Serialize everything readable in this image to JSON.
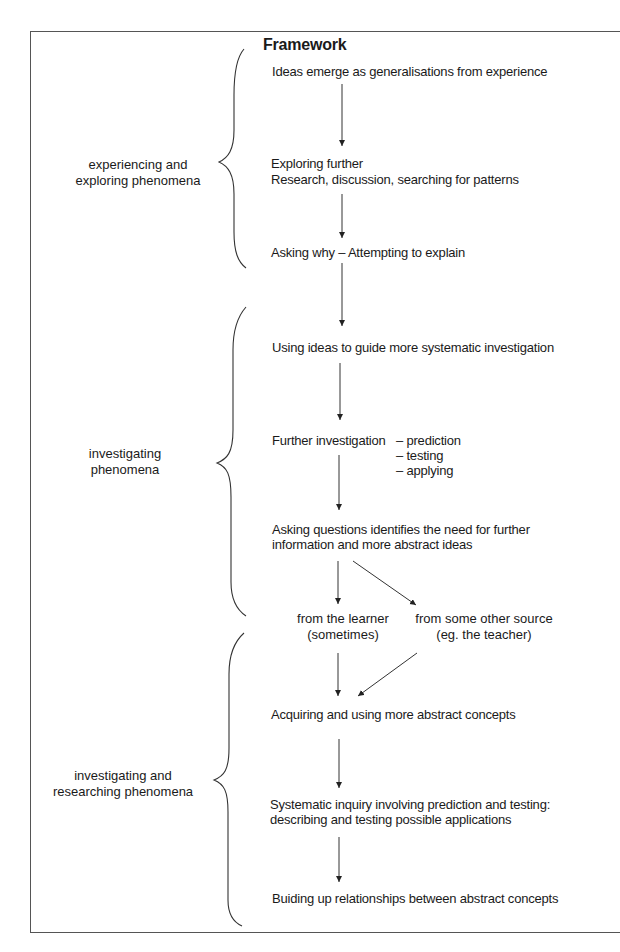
{
  "title": "Framework",
  "phases": [
    {
      "label_lines": [
        "experiencing and",
        "exploring phenomena"
      ]
    },
    {
      "label_lines": [
        "investigating",
        "phenomena"
      ]
    },
    {
      "label_lines": [
        "investigating and",
        "researching phenomena"
      ]
    }
  ],
  "steps": {
    "ideas_emerge": "Ideas emerge as generalisations from experience",
    "exploring_1": "Exploring further",
    "exploring_2": "Research, discussion, searching for patterns",
    "asking_why": "Asking why – Attempting to explain",
    "using_ideas": "Using ideas to guide more systematic investigation",
    "further_investigation": "Further investigation",
    "sub_prediction": "– prediction",
    "sub_testing": "– testing",
    "sub_applying": "– applying",
    "asking_questions_1": "Asking questions identifies the need for further",
    "asking_questions_2": "information and more abstract ideas",
    "from_learner_1": "from the learner",
    "from_learner_2": "(sometimes)",
    "from_other_1": "from some other source",
    "from_other_2": "(eg. the teacher)",
    "acquiring": "Acquiring and using more abstract concepts",
    "systematic_1": "Systematic inquiry involving prediction and testing:",
    "systematic_2": "describing and testing possible applications",
    "building": "Buiding up relationships between abstract concepts"
  },
  "colors": {
    "line": "#333333",
    "text": "#1a1a1a",
    "frame": "#555555"
  }
}
